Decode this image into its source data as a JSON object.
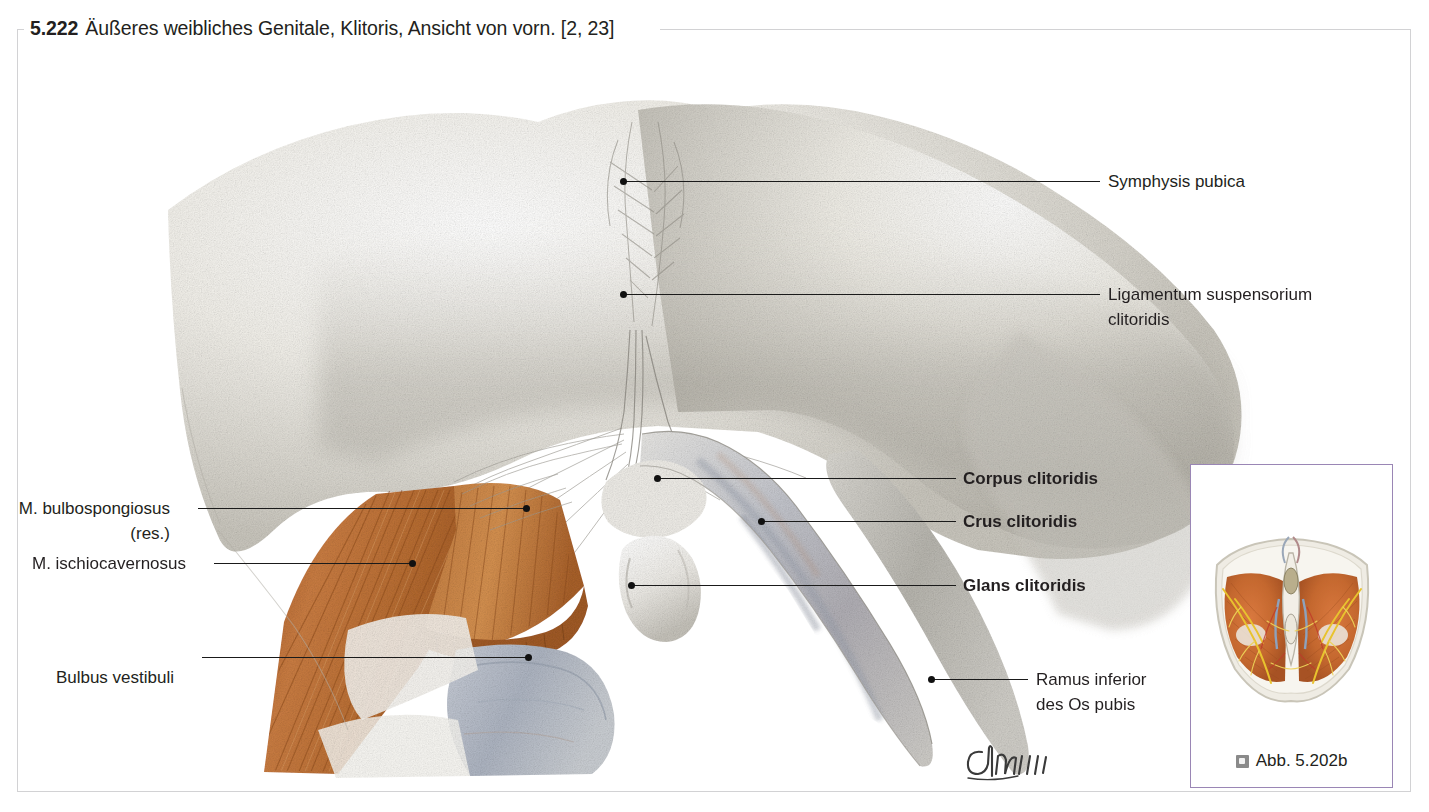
{
  "figure": {
    "number": "5.222",
    "caption": "Äußeres weibliches Genitale, Klitoris, Ansicht von vorn. [2, 23]",
    "frame_color": "#d2d2d4",
    "background": "#ffffff"
  },
  "illustration": {
    "kind": "anatomical-drawing",
    "subject": "female external genitalia, clitoris, anterior view",
    "technique": "pencil / colored-pencil medical illustration",
    "palette": {
      "tissue_gray": "#cfcdc6",
      "muscle_orange": "#c1703a",
      "erectile_blue_gray": "#a9b0bd",
      "leader_line": "#1a1a1a"
    },
    "artist_signature": "Gmbh"
  },
  "labels": {
    "right": [
      {
        "text": "Symphysis pubica",
        "bold": false
      },
      {
        "text": "Ligamentum suspensorium\nclitoridis",
        "bold": false
      },
      {
        "text": "Corpus clitoridis",
        "bold": true
      },
      {
        "text": "Crus clitoridis",
        "bold": true
      },
      {
        "text": "Glans clitoridis",
        "bold": true
      },
      {
        "text": "Ramus inferior\ndes Os pubis",
        "bold": false
      }
    ],
    "left": [
      {
        "text": "M. bulbospongiosus\n(res.)",
        "bold": false
      },
      {
        "text": "M. ischiocavernosus",
        "bold": false
      },
      {
        "text": "Bulbus vestibuli",
        "bold": false
      }
    ]
  },
  "inset": {
    "caption": "Abb. 5.202b",
    "icon": "small-square-icon",
    "border_color": "#9a86b5",
    "thumbnail_description": "axial perineal section, orange muscles with yellow nerves"
  }
}
